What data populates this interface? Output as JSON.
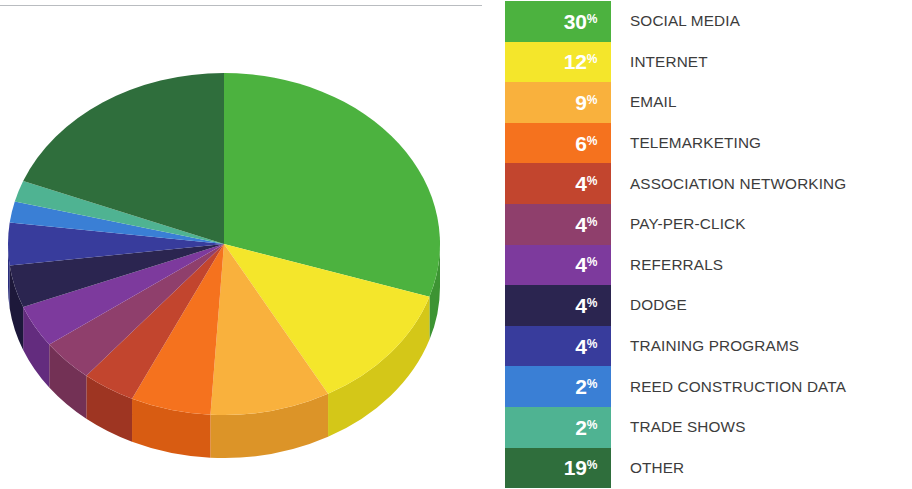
{
  "chart_data": {
    "type": "pie",
    "title": "",
    "subtitle": "",
    "xlabel": "",
    "ylabel": "",
    "legend_position": "right",
    "grid": false,
    "unit": "%",
    "three_d": true,
    "start_angle_deg": 0,
    "direction": "clockwise",
    "total": 100,
    "categories": [
      "SOCIAL MEDIA",
      "INTERNET",
      "EMAIL",
      "TELEMARKETING",
      "ASSOCIATION NETWORKING",
      "PAY-PER-CLICK",
      "REFERRALS",
      "DODGE",
      "TRAINING PROGRAMS",
      "REED CONSTRUCTION DATA",
      "TRADE SHOWS",
      "OTHER"
    ],
    "values": [
      30,
      12,
      9,
      6,
      4,
      4,
      4,
      4,
      4,
      2,
      2,
      19
    ],
    "value_labels": [
      "30",
      "12",
      "9",
      "6",
      "4",
      "4",
      "4",
      "4",
      "4",
      "2",
      "2",
      "19"
    ],
    "colors": [
      "#4cb23f",
      "#f4e62b",
      "#f9b13d",
      "#f5721e",
      "#c2452e",
      "#8f3f6c",
      "#7d3a9d",
      "#2b2550",
      "#383c9c",
      "#3a7fd5",
      "#4fb392",
      "#2f6e3c"
    ],
    "side_colors": [
      "#3d9433",
      "#d4c718",
      "#dc9428",
      "#d85c12",
      "#9e3522",
      "#733155",
      "#632c7e",
      "#1d183a",
      "#2a2d7c",
      "#2c66ad",
      "#3d9476",
      "#24572e"
    ],
    "slices": [
      {
        "label": "SOCIAL MEDIA",
        "value": 30,
        "pct_text": "30",
        "color": "#4cb23f"
      },
      {
        "label": "INTERNET",
        "value": 12,
        "pct_text": "12",
        "color": "#f4e62b"
      },
      {
        "label": "EMAIL",
        "value": 9,
        "pct_text": "9",
        "color": "#f9b13d"
      },
      {
        "label": "TELEMARKETING",
        "value": 6,
        "pct_text": "6",
        "color": "#f5721e"
      },
      {
        "label": "ASSOCIATION NETWORKING",
        "value": 4,
        "pct_text": "4",
        "color": "#c2452e"
      },
      {
        "label": "PAY-PER-CLICK",
        "value": 4,
        "pct_text": "4",
        "color": "#8f3f6c"
      },
      {
        "label": "REFERRALS",
        "value": 4,
        "pct_text": "4",
        "color": "#7d3a9d"
      },
      {
        "label": "DODGE",
        "value": 4,
        "pct_text": "4",
        "color": "#2b2550"
      },
      {
        "label": "TRAINING PROGRAMS",
        "value": 4,
        "pct_text": "4",
        "color": "#383c9c"
      },
      {
        "label": "REED CONSTRUCTION DATA",
        "value": 2,
        "pct_text": "2",
        "color": "#3a7fd5"
      },
      {
        "label": "TRADE SHOWS",
        "value": 2,
        "pct_text": "2",
        "color": "#4fb392"
      },
      {
        "label": "OTHER",
        "value": 19,
        "pct_text": "19",
        "color": "#2f6e3c"
      }
    ]
  },
  "legend": {
    "percent_symbol": "%",
    "rows": [
      {
        "pct": "30",
        "label": "SOCIAL MEDIA",
        "color": "#4cb23f"
      },
      {
        "pct": "12",
        "label": "INTERNET",
        "color": "#f4e62b"
      },
      {
        "pct": "9",
        "label": "EMAIL",
        "color": "#f9b13d"
      },
      {
        "pct": "6",
        "label": "TELEMARKETING",
        "color": "#f5721e"
      },
      {
        "pct": "4",
        "label": "ASSOCIATION NETWORKING",
        "color": "#c2452e"
      },
      {
        "pct": "4",
        "label": "PAY-PER-CLICK",
        "color": "#8f3f6c"
      },
      {
        "pct": "4",
        "label": "REFERRALS",
        "color": "#7d3a9d"
      },
      {
        "pct": "4",
        "label": "DODGE",
        "color": "#2b2550"
      },
      {
        "pct": "4",
        "label": "TRAINING PROGRAMS",
        "color": "#383c9c"
      },
      {
        "pct": "2",
        "label": "REED CONSTRUCTION DATA",
        "color": "#3a7fd5"
      },
      {
        "pct": "2",
        "label": "TRADE SHOWS",
        "color": "#4fb392"
      },
      {
        "pct": "19",
        "label": "OTHER",
        "color": "#2f6e3c"
      }
    ]
  },
  "divider": {
    "color": "#b9bcc0"
  }
}
